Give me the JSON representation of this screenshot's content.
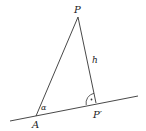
{
  "diagram": {
    "points": {
      "P": {
        "label": "P",
        "x": 78,
        "y": 17
      },
      "A": {
        "label": "A",
        "x": 36,
        "y": 116
      },
      "P_prime": {
        "label": "P′",
        "x": 96,
        "y": 103
      }
    },
    "line": {
      "x1": 10,
      "y1": 121,
      "x2": 138,
      "y2": 96
    },
    "labels": {
      "P": "P",
      "A": "A",
      "P_prime": "P′",
      "h": "h",
      "alpha": "α"
    },
    "colors": {
      "stroke": "#333333",
      "text": "#222222"
    }
  }
}
